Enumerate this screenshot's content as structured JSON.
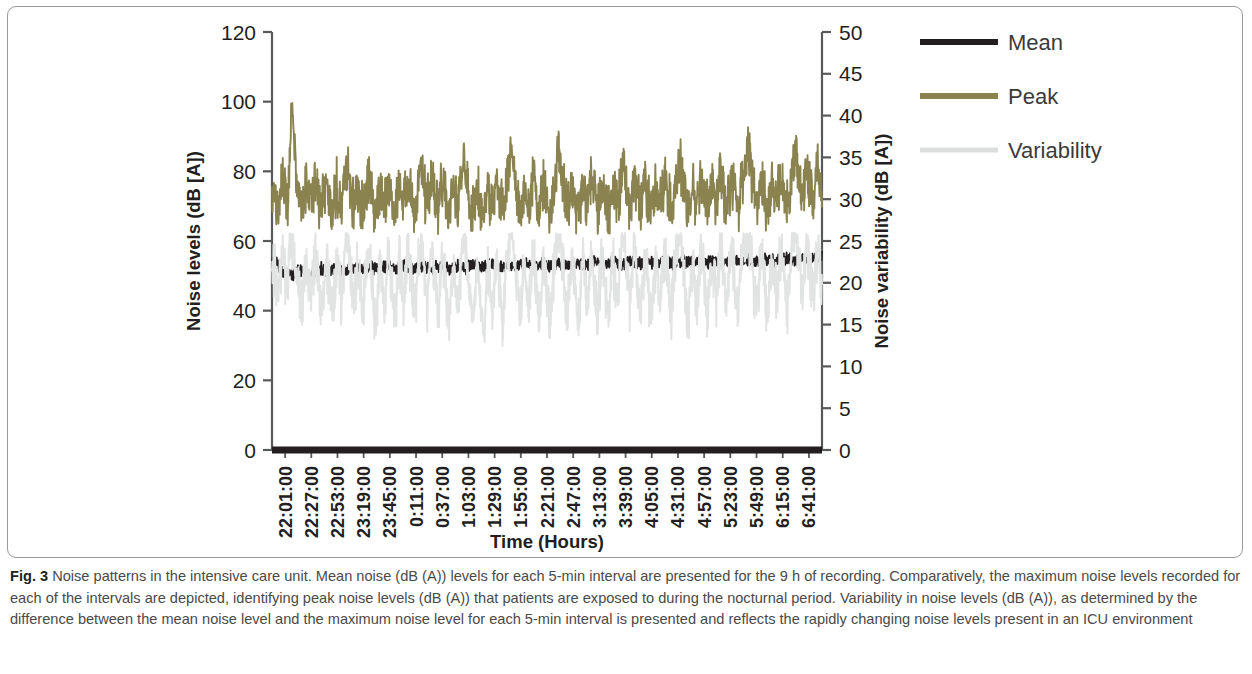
{
  "figure": {
    "label": "Fig. 3",
    "caption": "Noise patterns in the intensive care unit. Mean noise (dB (A)) levels for each 5-min interval are presented for the 9 h of recording. Comparatively, the maximum noise levels recorded for each of the intervals are depicted, identifying peak noise levels (dB (A)) that patients are exposed to during the nocturnal period. Variability in noise levels (dB (A)), as determined by the difference between the mean noise level and the maximum noise level for each 5-min interval is presented and reflects the rapidly changing noise levels present in an ICU environment"
  },
  "chart_data": {
    "type": "line",
    "title": "",
    "xlabel": "Time (Hours)",
    "ylabel": "Noise levels (dB [A])",
    "y2label": "Noise variability (dB [A])",
    "ylim": [
      0,
      120
    ],
    "y2lim": [
      0,
      50
    ],
    "yticks": [
      0,
      20,
      40,
      60,
      80,
      100,
      120
    ],
    "y2ticks": [
      0,
      5,
      10,
      15,
      20,
      25,
      30,
      35,
      40,
      45,
      50
    ],
    "grid": false,
    "legend_position": "right",
    "xtick_labels": [
      "22:01:00",
      "22:27:00",
      "22:53:00",
      "23:19:00",
      "23:45:00",
      "0:11:00",
      "0:37:00",
      "1:03:00",
      "1:29:00",
      "1:55:00",
      "2:21:00",
      "2:47:00",
      "3:13:00",
      "3:39:00",
      "4:05:00",
      "4:31:00",
      "4:57:00",
      "5:23:00",
      "5:49:00",
      "6:15:00",
      "6:41:00"
    ],
    "series": [
      {
        "name": "Mean",
        "color": "#231f20",
        "axis": "left",
        "mean_level": 52.5,
        "range": [
          48,
          57
        ],
        "values": [
          54.2,
          54.0,
          53.6,
          53.2,
          52.4,
          51.6,
          51.0,
          50.6,
          50.3,
          50.4,
          50.7,
          51.0,
          51.3,
          51.5,
          51.4,
          51.2,
          51.0,
          50.8,
          50.9,
          51.2,
          51.5,
          51.7,
          51.9,
          52.0,
          51.8,
          51.6,
          51.5,
          51.7,
          52.0,
          52.2,
          52.3,
          52.1,
          51.9,
          51.7,
          51.6,
          51.8,
          52.1,
          52.3,
          52.4,
          52.2,
          52.0,
          51.8,
          51.7,
          51.9,
          52.2,
          52.4,
          52.5,
          52.3,
          52.1,
          51.9,
          51.8,
          52.0,
          52.3,
          52.5,
          52.6,
          52.4,
          52.2,
          52.0,
          51.9,
          52.1,
          52.4,
          52.6,
          52.7,
          52.5,
          52.3,
          52.1,
          52.0,
          52.2,
          52.5,
          52.7,
          52.8,
          52.6,
          52.4,
          52.2,
          52.1,
          52.3,
          52.6,
          52.8,
          52.9,
          52.7,
          52.5,
          52.3,
          52.2,
          52.4,
          52.7,
          52.9,
          53.0,
          52.8,
          52.6,
          52.4,
          52.3,
          52.5,
          52.8,
          53.0,
          53.1,
          52.9,
          52.7,
          52.5,
          52.4,
          52.6,
          52.9,
          53.1,
          53.2,
          53.0,
          52.8,
          52.6,
          52.5,
          52.7,
          53.0,
          53.2,
          53.3,
          53.1,
          52.9,
          52.7,
          52.6,
          52.8,
          53.1,
          53.3,
          53.4,
          53.2,
          53.0,
          52.8,
          52.7,
          52.9,
          53.2,
          53.4,
          53.5,
          53.3,
          53.1,
          52.9,
          52.8,
          53.0,
          53.3,
          53.5,
          53.6,
          53.4,
          53.2,
          53.0,
          52.9,
          53.1,
          53.4,
          53.6,
          53.7,
          53.5,
          53.3,
          53.1,
          53.0,
          53.2,
          53.5,
          53.7,
          53.8,
          53.6,
          53.4,
          53.2,
          53.1,
          53.3,
          53.6,
          53.8,
          53.9,
          53.7,
          53.5,
          53.3,
          53.2,
          53.4,
          53.7,
          53.9,
          54.0,
          53.8,
          53.6,
          53.4,
          53.3,
          53.5,
          53.8,
          54.0,
          54.1,
          53.9,
          53.7,
          53.5,
          53.4,
          53.6,
          53.9,
          54.1,
          54.2,
          54.0,
          53.8,
          53.6,
          53.5,
          53.7,
          54.0,
          54.2,
          54.3,
          54.1,
          53.9,
          53.7,
          53.6,
          53.8,
          54.1,
          54.3,
          54.4,
          54.2,
          54.0,
          53.8,
          53.7,
          53.9,
          54.2,
          54.4,
          54.5,
          54.3,
          54.1,
          53.9,
          53.8,
          54.0,
          54.3,
          54.5,
          54.6,
          54.4,
          54.2,
          54.0,
          53.9,
          54.1,
          54.4,
          54.6,
          54.7,
          54.5,
          54.3,
          54.1,
          54.0,
          54.2,
          54.5,
          54.7,
          54.8,
          54.6,
          54.4,
          54.2,
          54.1,
          54.3,
          54.6,
          54.8,
          54.9,
          54.7,
          54.5,
          54.3,
          54.2,
          54.4,
          54.7,
          54.9,
          55.0,
          54.8,
          54.6,
          54.4,
          54.3,
          54.5,
          54.8,
          55.0,
          55.1,
          55.5
        ]
      },
      {
        "name": "Peak",
        "color": "#8a8350",
        "axis": "left",
        "mean_level": 74,
        "range": [
          62,
          100
        ],
        "values": [
          72,
          75,
          71,
          69,
          74,
          78,
          73,
          70,
          76,
          99,
          92,
          80,
          74,
          71,
          69,
          73,
          76,
          72,
          70,
          74,
          78,
          75,
          71,
          69,
          73,
          77,
          74,
          70,
          68,
          72,
          76,
          73,
          70,
          74,
          79,
          82,
          77,
          72,
          69,
          73,
          76,
          71,
          68,
          72,
          77,
          80,
          75,
          70,
          67,
          71,
          75,
          72,
          69,
          73,
          78,
          74,
          70,
          68,
          72,
          76,
          73,
          70,
          74,
          79,
          75,
          71,
          68,
          72,
          77,
          83,
          78,
          73,
          70,
          74,
          78,
          75,
          71,
          69,
          73,
          77,
          74,
          70,
          68,
          72,
          76,
          73,
          70,
          74,
          79,
          84,
          79,
          74,
          70,
          68,
          72,
          76,
          73,
          69,
          67,
          71,
          75,
          72,
          69,
          73,
          77,
          74,
          71,
          68,
          72,
          76,
          80,
          85,
          80,
          75,
          71,
          68,
          72,
          76,
          73,
          70,
          74,
          78,
          75,
          71,
          69,
          73,
          77,
          74,
          70,
          68,
          72,
          76,
          82,
          86,
          81,
          76,
          72,
          69,
          73,
          77,
          74,
          70,
          68,
          72,
          76,
          73,
          70,
          74,
          78,
          75,
          71,
          69,
          73,
          77,
          74,
          71,
          68,
          72,
          76,
          73,
          70,
          74,
          79,
          83,
          78,
          73,
          70,
          74,
          78,
          75,
          71,
          69,
          73,
          77,
          74,
          70,
          68,
          72,
          76,
          73,
          70,
          74,
          78,
          75,
          72,
          69,
          73,
          77,
          80,
          84,
          79,
          74,
          70,
          68,
          72,
          76,
          73,
          70,
          74,
          78,
          75,
          71,
          69,
          73,
          77,
          74,
          71,
          75,
          79,
          76,
          72,
          70,
          74,
          78,
          75,
          71,
          69,
          73,
          77,
          80,
          83,
          86,
          81,
          76,
          72,
          70,
          74,
          78,
          75,
          71,
          69,
          73,
          77,
          74,
          71,
          75,
          79,
          76,
          72,
          70,
          74,
          78,
          82,
          85,
          80,
          76,
          73,
          77,
          81,
          78,
          74,
          72,
          76,
          80,
          77,
          74
        ]
      },
      {
        "name": "Variability",
        "color": "#e2e4e3",
        "axis": "right",
        "mean_level": 22,
        "range": [
          10,
          26
        ],
        "values": [
          21,
          22,
          20,
          18,
          22,
          24,
          21,
          19,
          23,
          25,
          24,
          22,
          20,
          18,
          17,
          21,
          23,
          20,
          18,
          21,
          24,
          22,
          19,
          17,
          20,
          23,
          21,
          18,
          16,
          19,
          23,
          21,
          18,
          21,
          24,
          26,
          23,
          20,
          17,
          20,
          23,
          19,
          16,
          19,
          23,
          25,
          22,
          18,
          15,
          18,
          22,
          20,
          17,
          20,
          24,
          21,
          18,
          16,
          19,
          23,
          20,
          17,
          21,
          24,
          22,
          19,
          16,
          19,
          23,
          26,
          24,
          20,
          17,
          20,
          24,
          22,
          18,
          16,
          19,
          23,
          21,
          18,
          15,
          18,
          22,
          20,
          17,
          20,
          24,
          26,
          24,
          21,
          17,
          15,
          19,
          23,
          20,
          16,
          14,
          17,
          22,
          19,
          16,
          20,
          23,
          21,
          18,
          15,
          19,
          23,
          25,
          26,
          24,
          21,
          18,
          15,
          19,
          23,
          20,
          17,
          21,
          24,
          22,
          18,
          16,
          20,
          23,
          21,
          17,
          15,
          19,
          23,
          25,
          26,
          25,
          22,
          18,
          16,
          20,
          23,
          21,
          17,
          15,
          19,
          23,
          20,
          17,
          21,
          24,
          22,
          18,
          16,
          20,
          23,
          21,
          18,
          15,
          19,
          23,
          20,
          17,
          21,
          24,
          26,
          23,
          20,
          17,
          21,
          24,
          22,
          18,
          16,
          20,
          23,
          21,
          17,
          15,
          19,
          23,
          20,
          17,
          21,
          24,
          22,
          19,
          16,
          20,
          23,
          25,
          26,
          24,
          21,
          17,
          15,
          19,
          23,
          20,
          17,
          21,
          24,
          22,
          18,
          16,
          20,
          23,
          21,
          18,
          22,
          24,
          22,
          19,
          17,
          21,
          24,
          22,
          18,
          16,
          20,
          23,
          25,
          26,
          26,
          24,
          21,
          18,
          17,
          21,
          24,
          22,
          18,
          16,
          20,
          23,
          21,
          18,
          22,
          24,
          22,
          19,
          17,
          21,
          24,
          25,
          26,
          24,
          21,
          19,
          22,
          25,
          23,
          20,
          18,
          22,
          24,
          22,
          20
        ]
      }
    ]
  },
  "legend": {
    "items": [
      {
        "label": "Mean",
        "color": "#231f20"
      },
      {
        "label": "Peak",
        "color": "#8a8350"
      },
      {
        "label": "Variability",
        "color": "#dcdedd"
      }
    ]
  }
}
